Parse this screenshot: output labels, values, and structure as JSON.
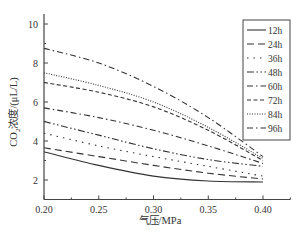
{
  "chart_data": {
    "type": "line",
    "title": "",
    "xlabel": "气压/MPa",
    "ylabel": "CO2浓度/(μL/L)",
    "xlim": [
      0.2,
      0.425
    ],
    "ylim": [
      1.0,
      10.5
    ],
    "xticks": [
      "0.20",
      "0.25",
      "0.30",
      "0.35",
      "0.40"
    ],
    "yticks": [
      "2",
      "4",
      "6",
      "8",
      "10"
    ],
    "grid": false,
    "legend_position": "upper right",
    "x": [
      0.2,
      0.25,
      0.3,
      0.35,
      0.4
    ],
    "series": [
      {
        "name": "12h",
        "style": "solid",
        "values": [
          3.45,
          2.75,
          2.2,
          1.95,
          1.9
        ]
      },
      {
        "name": "24h",
        "style": "longdash",
        "values": [
          3.65,
          3.2,
          2.75,
          2.35,
          2.05
        ]
      },
      {
        "name": "36h",
        "style": "dotted",
        "values": [
          4.4,
          3.75,
          3.2,
          2.7,
          2.2
        ]
      },
      {
        "name": "48h",
        "style": "dashdotdot",
        "values": [
          5.0,
          4.3,
          3.6,
          3.05,
          2.7
        ]
      },
      {
        "name": "60h",
        "style": "dashdot",
        "values": [
          5.7,
          5.2,
          4.55,
          3.75,
          2.85
        ]
      },
      {
        "name": "72h",
        "style": "dashed",
        "values": [
          7.0,
          6.5,
          5.75,
          4.55,
          3.0
        ]
      },
      {
        "name": "84h",
        "style": "finedot",
        "values": [
          7.5,
          6.85,
          6.0,
          4.7,
          3.1
        ]
      },
      {
        "name": "96h",
        "style": "dashdot",
        "values": [
          8.75,
          8.0,
          6.8,
          5.2,
          3.2
        ]
      }
    ]
  }
}
